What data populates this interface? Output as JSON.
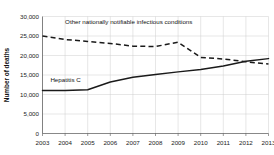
{
  "chart_data": {
    "type": "line",
    "title": "",
    "xlabel": "",
    "ylabel": "Number of deaths",
    "x": [
      2003,
      2004,
      2005,
      2006,
      2007,
      2008,
      2009,
      2010,
      2011,
      2012,
      2013
    ],
    "xtick_labels": [
      "2003",
      "2004",
      "2005",
      "2006",
      "2007",
      "2008",
      "2009",
      "2010",
      "2011",
      "2012",
      "2013"
    ],
    "ytick_labels": [
      "0",
      "5,000",
      "10,000",
      "15,000",
      "20,000",
      "25,000",
      "30,000"
    ],
    "ytick_values": [
      0,
      5000,
      10000,
      15000,
      20000,
      25000,
      30000
    ],
    "ylim": [
      0,
      30000
    ],
    "xlim": [
      2003,
      2013
    ],
    "grid": true,
    "legend_position": "inline-annotation",
    "series": [
      {
        "name": "Other nationally notifiable infectious conditions",
        "style": "dashed",
        "color": "#1a1a1a",
        "values": [
          25000,
          24100,
          23600,
          23100,
          22400,
          22300,
          23400,
          19500,
          19100,
          18400,
          17800
        ],
        "annotation": "Other nationally notifiable infectious conditions",
        "annotation_x": 2004.0,
        "annotation_y": 28200
      },
      {
        "name": "Hepatitis C",
        "style": "solid",
        "color": "#1a1a1a",
        "values": [
          11000,
          11000,
          11200,
          13200,
          14400,
          15100,
          15800,
          16400,
          17300,
          18500,
          19200
        ],
        "annotation": "Hepatitis C",
        "annotation_x": 2003.35,
        "annotation_y": 13100
      }
    ]
  }
}
